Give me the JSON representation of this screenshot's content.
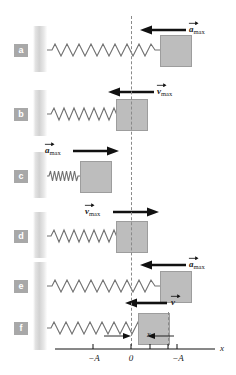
{
  "figure": {
    "equilibrium_label": "0",
    "colors": {
      "block_fill": "#bdbdbd",
      "block_stroke": "#9d9d9d",
      "wall_fill": "#d2d2d2",
      "tab_fill": "#a8a8a8",
      "tab_text": "#ffffff",
      "line": "#1a1a1a",
      "dashed": "#8a8a8a"
    }
  },
  "panels": [
    {
      "letter": "a",
      "vector_symbol": "a",
      "vector_subscript": "max",
      "vector_label": "a_max",
      "arrow_direction": "left",
      "block_position": "right-amplitude",
      "spring_state": "stretched"
    },
    {
      "letter": "b",
      "vector_symbol": "v",
      "vector_subscript": "max",
      "vector_label": "v_max",
      "arrow_direction": "left",
      "block_position": "equilibrium",
      "spring_state": "natural"
    },
    {
      "letter": "c",
      "vector_symbol": "a",
      "vector_subscript": "max",
      "vector_label": "a_max",
      "arrow_direction": "right",
      "block_position": "left-amplitude",
      "spring_state": "compressed"
    },
    {
      "letter": "d",
      "vector_symbol": "v",
      "vector_subscript": "max",
      "vector_label": "v_max",
      "arrow_direction": "right",
      "block_position": "equilibrium",
      "spring_state": "natural"
    },
    {
      "letter": "e",
      "vector_symbol": "a",
      "vector_subscript": "max",
      "vector_label": "a_max",
      "arrow_direction": "left",
      "block_position": "right-amplitude",
      "spring_state": "stretched"
    },
    {
      "letter": "f",
      "vector_symbol": "v",
      "vector_subscript": "",
      "vector_label": "v",
      "arrow_direction": "left",
      "block_position": "between",
      "spring_state": "stretched",
      "dimension_label": "x"
    }
  ],
  "axis": {
    "label": "x",
    "ticks": [
      {
        "label": "−A",
        "position_px": 93
      },
      {
        "label": "0",
        "position_px": 131
      },
      {
        "label": "−A",
        "position_px": 177
      }
    ],
    "unlabeled_ticks_px": [
      150,
      203
    ]
  }
}
